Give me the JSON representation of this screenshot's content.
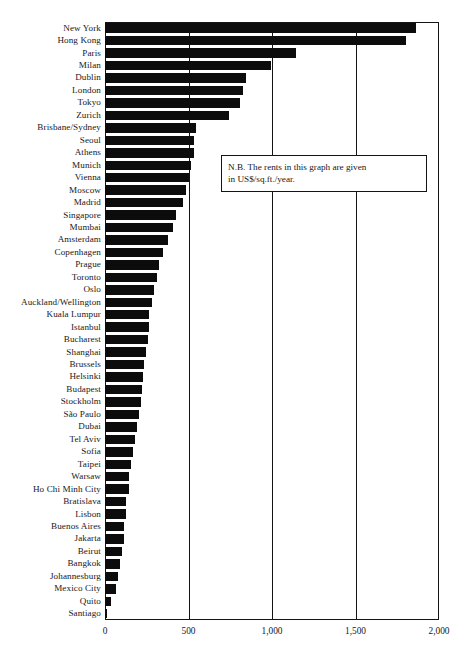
{
  "chart_data": {
    "type": "bar",
    "orientation": "horizontal",
    "title": "",
    "subtitle": "",
    "xlabel": "",
    "ylabel": "",
    "xlim": [
      0,
      2000
    ],
    "xticks": [
      0,
      500,
      1000,
      1500,
      2000
    ],
    "xtick_labels": [
      "0",
      "500",
      "1,000",
      "1,500",
      "2,000"
    ],
    "grid": "vertical",
    "legend": "none",
    "bar_color": "#0c0c0c",
    "axis_color": "#141414",
    "units": "US$/sq.ft./year",
    "annotations": [
      {
        "name": "units-note",
        "text": "N.B. The rents in this graph are given in US$/sq.ft./year.",
        "line1": "N.B. The rents in this graph are given",
        "line2": "in US$/sq.ft./year."
      }
    ],
    "categories": [
      "New York",
      "Hong Kong",
      "Paris",
      "Milan",
      "Dublin",
      "London",
      "Tokyo",
      "Zurich",
      "Brisbane/Sydney",
      "Seoul",
      "Athens",
      "Munich",
      "Vienna",
      "Moscow",
      "Madrid",
      "Singapore",
      "Mumbai",
      "Amsterdam",
      "Copenhagen",
      "Prague",
      "Toronto",
      "Oslo",
      "Auckland/Wellington",
      "Kuala Lumpur",
      "Istanbul",
      "Bucharest",
      "Shanghai",
      "Brussels",
      "Helsinki",
      "Budapest",
      "Stockholm",
      "São Paulo",
      "Dubai",
      "Tel Aviv",
      "Sofia",
      "Taipei",
      "Warsaw",
      "Ho Chi Minh City",
      "Bratislava",
      "Lisbon",
      "Buenos Aires",
      "Jakarta",
      "Beirut",
      "Bangkok",
      "Johannesburg",
      "Mexico City",
      "Quito",
      "Santiago"
    ],
    "values": [
      1860,
      1805,
      1145,
      995,
      845,
      825,
      810,
      740,
      545,
      535,
      530,
      515,
      505,
      485,
      465,
      425,
      405,
      380,
      350,
      325,
      312,
      296,
      283,
      266,
      262,
      257,
      243,
      231,
      226,
      224,
      216,
      205,
      193,
      180,
      166,
      155,
      145,
      142,
      126,
      124,
      114,
      113,
      100,
      90,
      78,
      64,
      37,
      9
    ]
  }
}
